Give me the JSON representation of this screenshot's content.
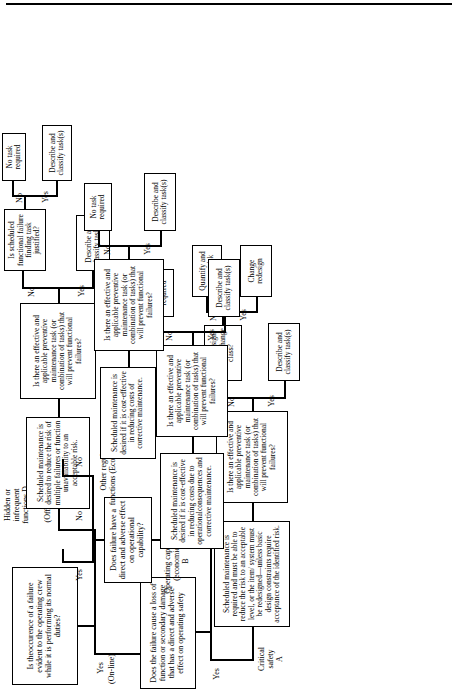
{
  "diagram": {
    "orientation": "rotated-90-ccw",
    "nodes": {
      "root": "Is theoccurence of a failure evident to the operating crew while it is performing its normal duties?",
      "root_yes": "Yes",
      "root_yes_sub": "(On-line)",
      "root_no": "No",
      "root_no_sub": "(Off-line)",
      "hidden_label": "Hidden or\ninfrequent\nfunctions D",
      "hidden_policy": "Scheduled maintenance is desired to reduce the risk of multiple failures or function unavailability to an acceptable risk.",
      "hidden_q": "Is there an effective and applicable preventive maintenance task (or combination of tasks) that will prevent functional failures?",
      "hidden_q_yes": "Yes",
      "hidden_q_no": "No",
      "hidden_yes_task": "Describe and classify task(s)",
      "hidden_ff_q": "Is scheduled functional failure finding task justified?",
      "hidden_ff_yes": "Yes",
      "hidden_ff_no": "No",
      "hidden_ff_yes_task": "Describe and classify task(s)",
      "hidden_ff_no_task": "No task required",
      "safety_q": "Does the failure cause a loss of function or secondary damage that has a direct and adverse effect on operating safety",
      "safety_yes": "Yes",
      "safety_no": "No",
      "critical_label": "Critical\nsafety\nA",
      "critical_policy": "Scheduled maintenance is required and must be able to reduce the risk to an acceptable level, or the item/ system must be redesigned—unless basic design constraints require acceptance of the identified risk.",
      "critical_q": "Is there an effective and applicable preventive maintenance task (or combination of tasks) that will prevent functional failures?",
      "critical_q_yes": "Yes",
      "critical_q_no": "No",
      "critical_yes_task": "Describe and classify task(s)",
      "redesign_q": "Can redesign critically change class?",
      "redesign_yes": "Yes",
      "redesign_no": "No",
      "redesign_yes_task": "Change redesign",
      "redesign_no_task": "Quantify and accept risk",
      "opcap_q": "Does failure have a direct and adverse effect on operational capability?",
      "opcap_yes": "Yes",
      "opcap_no": "No",
      "opcap_label": "Operating capability\n(economics)\nB",
      "opcap_policy": "Scheduled maintenance is desired if it is cost-effective in reducing costs due to operationalconsequences and corrective maintenance.",
      "opcap_task_q": "Is there an effective and applicable preventive maintenance task (or combination of tasks) that will prevent functional failures?",
      "opcap_task_yes": "Yes",
      "opcap_task_no": "No",
      "opcap_yes_task": "Describe and classify task(s)",
      "opcap_no_task": "No task required",
      "econ_label": "Other regular\nfunctions (Economics)",
      "econ_policy": "Scheduled maintenance is desired if it is cost-effective in reducing costs of corrective maintenance.",
      "econ_task_q": "Is there an effective and applicable preventive maintenance task (or combination of tasks) that will prevent functional failures?",
      "econ_task_yes": "Yes",
      "econ_task_no": "No",
      "econ_yes_task": "Describe and classify task(s)",
      "econ_no_task": "No task required"
    },
    "colors": {
      "stroke": "#000000",
      "background": "#ffffff"
    }
  }
}
